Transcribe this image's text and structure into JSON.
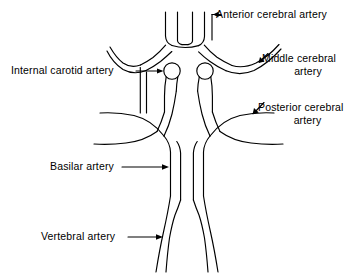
{
  "figure": {
    "kind": "anatomical-line-diagram",
    "background_color": "#ffffff",
    "stroke_color": "#000000",
    "width": 361,
    "height": 279
  },
  "labels": {
    "anterior_cerebral": {
      "text": "Anterior cerebral artery",
      "line1": "Anterior cerebral artery",
      "line2": ""
    },
    "middle_cerebral": {
      "text": "Middle cerebral artery",
      "line1": "Middle cerebral",
      "line2": "artery"
    },
    "posterior_cerebral": {
      "text": "Posterior cerebral artery",
      "line1": "Posterior cerebral",
      "line2": "artery"
    },
    "internal_carotid": {
      "text": "Internal carotid artery",
      "line1": "Internal carotid artery",
      "line2": ""
    },
    "basilar": {
      "text": "Basilar artery",
      "line1": "Basilar artery",
      "line2": ""
    },
    "vertebral": {
      "text": "Vertebral artery",
      "line1": "Vertebral artery",
      "line2": ""
    }
  },
  "leaders": {
    "anterior_cerebral": {
      "direction": "left",
      "target": "anterior-communicating-junction"
    },
    "middle_cerebral": {
      "direction": "down-left",
      "target": "right-middle-cerebral-branch"
    },
    "posterior_cerebral": {
      "direction": "down-left",
      "target": "right-posterior-cerebral-branch"
    },
    "internal_carotid": {
      "direction": "right",
      "target": "left-carotid-circle"
    },
    "basilar": {
      "direction": "right",
      "target": "basilar-trunk"
    },
    "vertebral": {
      "direction": "right",
      "target": "left-vertebral-artery"
    }
  },
  "structures": [
    {
      "name": "anterior-cerebral-artery-left",
      "type": "vessel"
    },
    {
      "name": "anterior-cerebral-artery-right",
      "type": "vessel"
    },
    {
      "name": "anterior-communicating-artery",
      "type": "vessel"
    },
    {
      "name": "internal-carotid-artery-left",
      "type": "vessel-with-circle"
    },
    {
      "name": "internal-carotid-artery-right",
      "type": "vessel-with-circle"
    },
    {
      "name": "middle-cerebral-artery-left",
      "type": "vessel"
    },
    {
      "name": "middle-cerebral-artery-right",
      "type": "vessel"
    },
    {
      "name": "posterior-communicating-artery-left",
      "type": "vessel"
    },
    {
      "name": "posterior-communicating-artery-right",
      "type": "vessel"
    },
    {
      "name": "posterior-cerebral-artery-left",
      "type": "vessel"
    },
    {
      "name": "posterior-cerebral-artery-right",
      "type": "vessel"
    },
    {
      "name": "basilar-artery",
      "type": "vessel"
    },
    {
      "name": "vertebral-artery-left",
      "type": "vessel"
    },
    {
      "name": "vertebral-artery-right",
      "type": "vessel"
    }
  ]
}
